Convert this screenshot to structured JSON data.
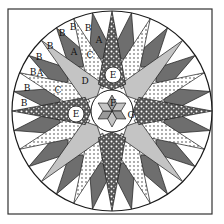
{
  "colors": {
    "dark": "#6e6e6e",
    "light": "#c4c4c4",
    "white": "#ffffff",
    "outline": "#1a1a1a",
    "dots": "#222222"
  },
  "labels": {
    "b": "B",
    "a": "A",
    "c": "C",
    "d": "D",
    "e": "E",
    "f": "F",
    "g": "G"
  },
  "visible_labels": [
    {
      "text": "B",
      "x": 62,
      "y": 33
    },
    {
      "text": "B",
      "x": 73,
      "y": 27
    },
    {
      "text": "B",
      "x": 88,
      "y": 28
    },
    {
      "text": "B",
      "x": 50,
      "y": 46
    },
    {
      "text": "B",
      "x": 39,
      "y": 57
    },
    {
      "text": "B",
      "x": 33,
      "y": 72
    },
    {
      "text": "B",
      "x": 27,
      "y": 88
    },
    {
      "text": "B",
      "x": 24,
      "y": 103
    },
    {
      "text": "A",
      "x": 40,
      "y": 73
    },
    {
      "text": "A",
      "x": 74,
      "y": 52
    },
    {
      "text": "A",
      "x": 99,
      "y": 40
    },
    {
      "text": "C",
      "x": 58,
      "y": 90
    },
    {
      "text": "C",
      "x": 90,
      "y": 55
    },
    {
      "text": "D",
      "x": 85,
      "y": 81
    },
    {
      "text": "E",
      "x": 113,
      "y": 75
    },
    {
      "text": "E",
      "x": 76,
      "y": 114
    },
    {
      "text": "F",
      "x": 113,
      "y": 103
    },
    {
      "text": "G",
      "x": 131,
      "y": 115
    }
  ]
}
